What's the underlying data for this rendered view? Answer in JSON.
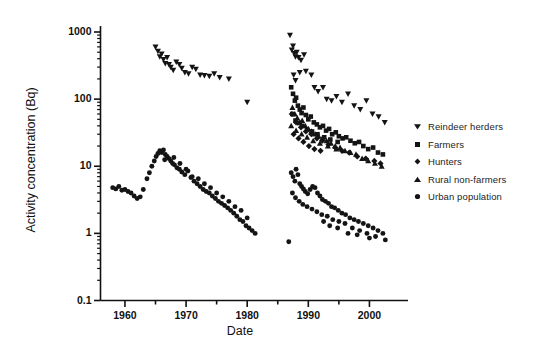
{
  "figure": {
    "title": "",
    "background": "#ffffff",
    "marker_color": "#141414"
  },
  "axes": {
    "x_title": "Date",
    "y_title": "Activity concentration (Bq)",
    "x_ticklabels": [
      "1960",
      "1970",
      "1980",
      "1990",
      "2000"
    ],
    "y_ticklabels": [
      "1000",
      "100",
      "10",
      "1",
      "0.1"
    ]
  },
  "legend": {
    "position": "right",
    "entries": [
      {
        "label": "Reindeer herders",
        "marker": "triangle-down-icon"
      },
      {
        "label": "Farmers",
        "marker": "square-icon"
      },
      {
        "label": "Hunters",
        "marker": "diamond-icon"
      },
      {
        "label": "Rural non-farmers",
        "marker": "triangle-up-icon"
      },
      {
        "label": "Urban population",
        "marker": "circle-icon"
      }
    ]
  },
  "chart_data": {
    "type": "scatter",
    "title": "",
    "xlabel": "Date",
    "ylabel": "Activity concentration (Bq)",
    "xlim": [
      1956,
      2005
    ],
    "ylim": [
      0.1,
      1000
    ],
    "yscale": "log",
    "xscale": "linear",
    "grid": false,
    "x_ticks": [
      1960,
      1965,
      1970,
      1975,
      1980,
      1985,
      1990,
      1995,
      2000
    ],
    "x_ticklabels": [
      "1960",
      "",
      "1970",
      "",
      "1980",
      "",
      "1990",
      "",
      "2000"
    ],
    "y_ticks": [
      0.1,
      1,
      10,
      100,
      1000
    ],
    "y_minor_ticks": true,
    "legend_position": "right",
    "series": [
      {
        "name": "Reindeer herders",
        "marker": "triangle-down",
        "color": "#141414",
        "points": [
          [
            1965.0,
            600
          ],
          [
            1965.4,
            520
          ],
          [
            1965.7,
            430
          ],
          [
            1966.0,
            470
          ],
          [
            1966.3,
            390
          ],
          [
            1966.6,
            340
          ],
          [
            1966.9,
            420
          ],
          [
            1967.2,
            330
          ],
          [
            1967.5,
            300
          ],
          [
            1967.9,
            270
          ],
          [
            1968.4,
            360
          ],
          [
            1968.9,
            330
          ],
          [
            1969.3,
            290
          ],
          [
            1969.8,
            250
          ],
          [
            1970.4,
            240
          ],
          [
            1971.0,
            300
          ],
          [
            1971.6,
            280
          ],
          [
            1972.3,
            230
          ],
          [
            1973.0,
            225
          ],
          [
            1973.8,
            220
          ],
          [
            1974.6,
            240
          ],
          [
            1975.5,
            210
          ],
          [
            1977.0,
            200
          ],
          [
            1980.0,
            90
          ],
          [
            1987.0,
            900
          ],
          [
            1987.3,
            540
          ],
          [
            1987.5,
            620
          ],
          [
            1987.7,
            480
          ],
          [
            1987.9,
            430
          ],
          [
            1988.1,
            500
          ],
          [
            1988.4,
            420
          ],
          [
            1988.8,
            380
          ],
          [
            1989.3,
            460
          ],
          [
            1987.6,
            230
          ],
          [
            1987.9,
            190
          ],
          [
            1988.6,
            250
          ],
          [
            1989.6,
            260
          ],
          [
            1990.5,
            230
          ],
          [
            1991.0,
            150
          ],
          [
            1991.6,
            130
          ],
          [
            1992.4,
            150
          ],
          [
            1993.0,
            100
          ],
          [
            1993.8,
            95
          ],
          [
            1994.6,
            110
          ],
          [
            1995.5,
            90
          ],
          [
            1996.5,
            120
          ],
          [
            1997.5,
            80
          ],
          [
            1998.5,
            70
          ],
          [
            1999.5,
            95
          ],
          [
            2000.5,
            60
          ],
          [
            2001.5,
            55
          ],
          [
            2002.5,
            45
          ]
        ]
      },
      {
        "name": "Farmers",
        "marker": "square",
        "color": "#141414",
        "points": [
          [
            1987.2,
            150
          ],
          [
            1987.5,
            120
          ],
          [
            1987.8,
            95
          ],
          [
            1988.0,
            105
          ],
          [
            1988.3,
            80
          ],
          [
            1988.6,
            70
          ],
          [
            1988.9,
            62
          ],
          [
            1989.2,
            75
          ],
          [
            1989.6,
            58
          ],
          [
            1990.0,
            50
          ],
          [
            1990.4,
            55
          ],
          [
            1990.9,
            45
          ],
          [
            1991.4,
            42
          ],
          [
            1991.9,
            38
          ],
          [
            1992.4,
            40
          ],
          [
            1992.9,
            34
          ],
          [
            1993.4,
            36
          ],
          [
            1993.9,
            30
          ],
          [
            1994.5,
            32
          ],
          [
            1995.0,
            28
          ],
          [
            1995.6,
            26
          ],
          [
            1996.2,
            27
          ],
          [
            1996.9,
            24
          ],
          [
            1997.6,
            22
          ],
          [
            1998.3,
            23
          ],
          [
            1999.0,
            20
          ],
          [
            1999.8,
            18
          ],
          [
            2000.6,
            19
          ],
          [
            2001.4,
            16
          ],
          [
            2002.2,
            15
          ],
          [
            1987.4,
            60
          ],
          [
            1987.9,
            48
          ],
          [
            1988.5,
            44
          ],
          [
            1989.0,
            40
          ],
          [
            1989.8,
            35
          ],
          [
            1990.6,
            33
          ],
          [
            1991.5,
            30
          ],
          [
            1992.6,
            27
          ],
          [
            1993.6,
            25
          ],
          [
            1994.8,
            23
          ]
        ]
      },
      {
        "name": "Hunters",
        "marker": "diamond",
        "color": "#141414",
        "points": [
          [
            1987.3,
            60
          ],
          [
            1988.0,
            45
          ],
          [
            1988.8,
            38
          ],
          [
            1989.6,
            33
          ],
          [
            1990.5,
            30
          ],
          [
            1991.4,
            26
          ],
          [
            1992.3,
            24
          ],
          [
            1993.3,
            21
          ],
          [
            1994.4,
            19
          ],
          [
            1995.5,
            17
          ],
          [
            1996.7,
            16
          ],
          [
            1998.0,
            14
          ],
          [
            1999.4,
            13
          ],
          [
            2000.8,
            12
          ],
          [
            2001.8,
            11
          ],
          [
            1987.6,
            30
          ],
          [
            1988.4,
            26
          ],
          [
            1989.2,
            23
          ],
          [
            1990.1,
            20
          ],
          [
            1991.0,
            18
          ],
          [
            1992.0,
            17
          ]
        ]
      },
      {
        "name": "Rural non-farmers",
        "marker": "triangle-up",
        "color": "#141414",
        "points": [
          [
            1987.4,
            75
          ],
          [
            1987.8,
            60
          ],
          [
            1988.2,
            52
          ],
          [
            1988.6,
            45
          ],
          [
            1989.0,
            48
          ],
          [
            1989.5,
            40
          ],
          [
            1990.0,
            36
          ],
          [
            1990.5,
            33
          ],
          [
            1991.1,
            30
          ],
          [
            1991.7,
            28
          ],
          [
            1992.3,
            26
          ],
          [
            1993.0,
            24
          ],
          [
            1993.7,
            22
          ],
          [
            1994.4,
            20
          ],
          [
            1995.2,
            19
          ],
          [
            1996.0,
            17
          ],
          [
            1996.9,
            16
          ],
          [
            1997.8,
            15
          ],
          [
            1998.8,
            13
          ],
          [
            1999.8,
            12
          ],
          [
            2000.9,
            11
          ],
          [
            2002.0,
            10
          ],
          [
            1987.2,
            40
          ],
          [
            1988.0,
            34
          ],
          [
            1988.9,
            30
          ],
          [
            1989.8,
            27
          ],
          [
            1990.8,
            24
          ],
          [
            1991.9,
            22
          ],
          [
            1993.2,
            20
          ],
          [
            1994.6,
            18
          ]
        ]
      },
      {
        "name": "Urban population",
        "marker": "circle",
        "color": "#141414",
        "points": [
          [
            1958.0,
            4.8
          ],
          [
            1958.5,
            4.6
          ],
          [
            1959.0,
            5.0
          ],
          [
            1959.5,
            4.4
          ],
          [
            1960.0,
            4.5
          ],
          [
            1960.5,
            4.2
          ],
          [
            1961.0,
            4.0
          ],
          [
            1961.5,
            3.6
          ],
          [
            1962.0,
            3.3
          ],
          [
            1962.5,
            3.5
          ],
          [
            1963.0,
            4.5
          ],
          [
            1963.6,
            6.5
          ],
          [
            1964.0,
            8.0
          ],
          [
            1964.4,
            10.0
          ],
          [
            1964.8,
            12.0
          ],
          [
            1965.1,
            14.0
          ],
          [
            1965.4,
            15.5
          ],
          [
            1965.7,
            17.0
          ],
          [
            1966.0,
            16.0
          ],
          [
            1966.3,
            17.5
          ],
          [
            1966.6,
            15.0
          ],
          [
            1966.9,
            14.0
          ],
          [
            1967.2,
            13.0
          ],
          [
            1967.5,
            12.0
          ],
          [
            1967.8,
            11.0
          ],
          [
            1968.1,
            10.5
          ],
          [
            1968.5,
            9.5
          ],
          [
            1968.9,
            9.0
          ],
          [
            1969.3,
            8.2
          ],
          [
            1969.8,
            7.5
          ],
          [
            1970.3,
            8.5
          ],
          [
            1970.8,
            6.8
          ],
          [
            1971.3,
            6.0
          ],
          [
            1971.8,
            5.5
          ],
          [
            1972.3,
            5.0
          ],
          [
            1972.8,
            4.5
          ],
          [
            1973.3,
            4.2
          ],
          [
            1973.8,
            4.0
          ],
          [
            1974.3,
            3.6
          ],
          [
            1974.8,
            3.3
          ],
          [
            1975.3,
            3.0
          ],
          [
            1975.8,
            2.8
          ],
          [
            1976.3,
            2.6
          ],
          [
            1976.8,
            2.4
          ],
          [
            1977.3,
            2.2
          ],
          [
            1977.8,
            2.0
          ],
          [
            1978.3,
            1.8
          ],
          [
            1978.8,
            1.6
          ],
          [
            1979.3,
            1.5
          ],
          [
            1979.8,
            1.3
          ],
          [
            1980.3,
            1.2
          ],
          [
            1980.8,
            1.1
          ],
          [
            1981.3,
            1.0
          ],
          [
            1968.0,
            13.5
          ],
          [
            1969.0,
            11.0
          ],
          [
            1971.0,
            7.0
          ],
          [
            1973.0,
            5.5
          ],
          [
            1975.0,
            4.0
          ],
          [
            1977.0,
            3.0
          ],
          [
            1979.0,
            2.2
          ],
          [
            1966.5,
            12.5
          ],
          [
            1970.0,
            9.0
          ],
          [
            1972.0,
            6.5
          ],
          [
            1974.0,
            4.8
          ],
          [
            1976.0,
            3.5
          ],
          [
            1978.0,
            2.5
          ],
          [
            1980.0,
            1.7
          ],
          [
            1986.8,
            0.75
          ],
          [
            1987.2,
            8.0
          ],
          [
            1987.5,
            7.0
          ],
          [
            1987.8,
            6.0
          ],
          [
            1988.0,
            9.0
          ],
          [
            1988.3,
            7.5
          ],
          [
            1988.6,
            5.5
          ],
          [
            1988.9,
            5.0
          ],
          [
            1989.2,
            4.6
          ],
          [
            1989.5,
            4.2
          ],
          [
            1989.9,
            3.9
          ],
          [
            1990.3,
            4.5
          ],
          [
            1990.7,
            5.0
          ],
          [
            1991.1,
            4.8
          ],
          [
            1991.5,
            4.0
          ],
          [
            1991.9,
            3.6
          ],
          [
            1992.3,
            3.2
          ],
          [
            1992.8,
            3.0
          ],
          [
            1993.3,
            2.8
          ],
          [
            1993.8,
            2.5
          ],
          [
            1994.3,
            2.4
          ],
          [
            1994.9,
            2.2
          ],
          [
            1995.5,
            2.0
          ],
          [
            1996.1,
            1.9
          ],
          [
            1996.8,
            1.7
          ],
          [
            1997.5,
            1.6
          ],
          [
            1998.2,
            1.5
          ],
          [
            1999.0,
            1.4
          ],
          [
            1999.8,
            1.3
          ],
          [
            2000.6,
            1.2
          ],
          [
            2001.4,
            1.1
          ],
          [
            2002.2,
            1.0
          ],
          [
            1987.4,
            4.0
          ],
          [
            1987.9,
            3.4
          ],
          [
            1988.5,
            3.0
          ],
          [
            1989.1,
            2.7
          ],
          [
            1989.8,
            2.5
          ],
          [
            1990.6,
            2.3
          ],
          [
            1991.4,
            2.1
          ],
          [
            1992.2,
            1.9
          ],
          [
            1993.1,
            1.8
          ],
          [
            1994.0,
            1.6
          ],
          [
            1995.0,
            1.5
          ],
          [
            1996.0,
            1.4
          ],
          [
            1997.2,
            1.2
          ],
          [
            1998.4,
            1.1
          ],
          [
            1999.6,
            1.0
          ],
          [
            2001.0,
            0.9
          ],
          [
            1992.5,
            1.5
          ],
          [
            1993.5,
            1.3
          ],
          [
            1994.8,
            1.2
          ],
          [
            1996.5,
            1.0
          ],
          [
            1998.0,
            0.95
          ],
          [
            2000.0,
            0.85
          ],
          [
            2002.6,
            0.8
          ]
        ]
      }
    ]
  }
}
